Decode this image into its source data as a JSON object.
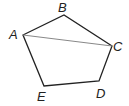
{
  "figure": {
    "type": "pentagon-with-diagonal",
    "vertices": [
      {
        "label": "A",
        "x": 23,
        "y": 35,
        "lx": 9,
        "ly": 38
      },
      {
        "label": "B",
        "x": 64,
        "y": 15,
        "lx": 58,
        "ly": 11
      },
      {
        "label": "C",
        "x": 112,
        "y": 46,
        "lx": 113,
        "ly": 51
      },
      {
        "label": "D",
        "x": 99,
        "y": 81,
        "lx": 96,
        "ly": 97
      },
      {
        "label": "E",
        "x": 44,
        "y": 86,
        "lx": 37,
        "ly": 101
      }
    ],
    "edges": [
      [
        "A",
        "B"
      ],
      [
        "B",
        "C"
      ],
      [
        "C",
        "D"
      ],
      [
        "D",
        "E"
      ],
      [
        "E",
        "A"
      ]
    ],
    "diagonal": [
      "A",
      "C"
    ],
    "colors": {
      "edge": "#222222",
      "diagonal": "#888888"
    }
  }
}
